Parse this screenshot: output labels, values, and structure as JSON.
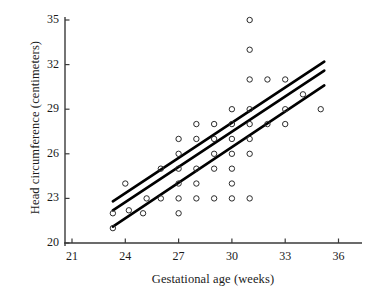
{
  "chart_data": {
    "type": "scatter",
    "title": "",
    "xlabel": "Gestational age (weeks)",
    "ylabel": "Head circumference (centimeters)",
    "xlim": [
      20.2,
      37.2
    ],
    "ylim": [
      19.3,
      35.6
    ],
    "xticks": [
      21,
      24,
      27,
      30,
      33,
      36
    ],
    "yticks": [
      20,
      23,
      26,
      29,
      32,
      35
    ],
    "xtick_labels": [
      "21",
      "24",
      "27",
      "30",
      "33",
      "36"
    ],
    "ytick_labels": [
      "20",
      "23",
      "26",
      "29",
      "32",
      "35"
    ],
    "grid": false,
    "legend": "none",
    "marker": "open-circle",
    "marker_color": "#2b2b2b",
    "line_color": "#000000",
    "points": [
      [
        23.3,
        21.0
      ],
      [
        23.3,
        22.0
      ],
      [
        24.0,
        24.0
      ],
      [
        24.2,
        22.2
      ],
      [
        25.0,
        22.0
      ],
      [
        25.2,
        23.0
      ],
      [
        26.0,
        25.0
      ],
      [
        26.0,
        23.0
      ],
      [
        27.0,
        27.0
      ],
      [
        27.0,
        26.0
      ],
      [
        27.0,
        25.0
      ],
      [
        27.0,
        24.0
      ],
      [
        27.0,
        23.0
      ],
      [
        27.0,
        22.0
      ],
      [
        28.0,
        28.0
      ],
      [
        28.0,
        27.0
      ],
      [
        28.0,
        25.0
      ],
      [
        28.0,
        24.0
      ],
      [
        28.0,
        23.0
      ],
      [
        29.0,
        28.0
      ],
      [
        29.0,
        27.0
      ],
      [
        29.0,
        26.0
      ],
      [
        29.0,
        25.0
      ],
      [
        29.0,
        23.0
      ],
      [
        30.0,
        29.0
      ],
      [
        30.0,
        28.0
      ],
      [
        30.0,
        27.0
      ],
      [
        30.0,
        26.0
      ],
      [
        30.0,
        25.0
      ],
      [
        30.0,
        24.0
      ],
      [
        30.0,
        23.0
      ],
      [
        31.0,
        35.0
      ],
      [
        31.0,
        33.0
      ],
      [
        31.0,
        31.0
      ],
      [
        31.0,
        29.0
      ],
      [
        31.0,
        28.0
      ],
      [
        31.0,
        27.0
      ],
      [
        31.0,
        26.0
      ],
      [
        31.0,
        23.0
      ],
      [
        32.0,
        31.0
      ],
      [
        32.0,
        28.0
      ],
      [
        33.0,
        31.0
      ],
      [
        33.0,
        29.0
      ],
      [
        33.0,
        28.0
      ],
      [
        34.0,
        30.0
      ],
      [
        35.0,
        29.0
      ]
    ],
    "lines": [
      {
        "name": "upper-confidence-line",
        "x": [
          23.3,
          35.2
        ],
        "y": [
          22.8,
          32.2
        ]
      },
      {
        "name": "regression-line",
        "x": [
          23.3,
          35.2
        ],
        "y": [
          22.2,
          31.6
        ]
      },
      {
        "name": "lower-confidence-line",
        "x": [
          23.3,
          35.2
        ],
        "y": [
          21.1,
          30.6
        ]
      }
    ]
  }
}
